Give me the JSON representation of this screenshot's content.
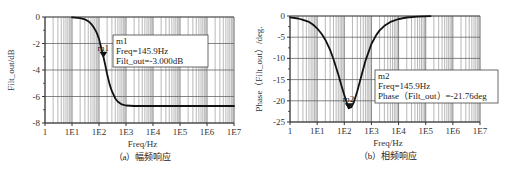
{
  "chart_data": [
    {
      "type": "line",
      "id": "magnitude",
      "caption": "（a）幅频响应",
      "xlabel": "Freq/Hz",
      "ylabel": "Filt_out/dB",
      "xscale": "log",
      "xlim": [
        1,
        10000000
      ],
      "ylim": [
        -8,
        0
      ],
      "x_ticks": [
        "1",
        "1E1",
        "1E2",
        "1E3",
        "1E4",
        "1E5",
        "1E6",
        "1E7"
      ],
      "y_ticks": [
        "0",
        "-2",
        "-4",
        "-6",
        "-8"
      ],
      "y_tick_values": [
        0,
        -2,
        -4,
        -6,
        -8
      ],
      "grid": true,
      "series": [
        {
          "name": "Filt_out",
          "x": [
            10,
            20,
            30,
            40,
            50,
            60,
            70,
            80,
            90,
            100,
            120,
            145.9,
            170,
            200,
            250,
            300,
            400,
            500,
            700,
            1000,
            2000,
            5000,
            10000,
            20000,
            100000,
            1000000,
            10000000
          ],
          "y": [
            -0.02,
            -0.08,
            -0.18,
            -0.32,
            -0.5,
            -0.7,
            -0.92,
            -1.15,
            -1.4,
            -1.65,
            -2.3,
            -3.0,
            -3.6,
            -4.3,
            -5.1,
            -5.6,
            -6.15,
            -6.4,
            -6.6,
            -6.68,
            -6.72,
            -6.72,
            -6.72,
            -6.72,
            -6.72,
            -6.72,
            -6.72
          ]
        }
      ],
      "marker": {
        "name": "m1",
        "freq_label": "Freq=145.9Hz",
        "value_label": "Filt_out=-3.000dB",
        "freq": 145.9,
        "value": -3.0
      }
    },
    {
      "type": "line",
      "id": "phase",
      "caption": "（b）相频响应",
      "xlabel": "Freq/Hz",
      "ylabel": "Phase（Filt_out）/deg.",
      "xscale": "log",
      "xlim": [
        1,
        10000000
      ],
      "ylim": [
        -25,
        0
      ],
      "x_ticks": [
        "1",
        "1E1",
        "1E2",
        "1E3",
        "1E4",
        "1E5",
        "1E6",
        "1E7"
      ],
      "y_ticks": [
        "0",
        "-5",
        "-10",
        "-15",
        "-20",
        "-25"
      ],
      "y_tick_values": [
        0,
        -5,
        -10,
        -15,
        -20,
        -25
      ],
      "grid": true,
      "series": [
        {
          "name": "Phase(Filt_out)",
          "x": [
            1,
            2,
            3,
            5,
            7,
            10,
            15,
            20,
            30,
            40,
            60,
            80,
            100,
            120,
            145.9,
            180,
            220,
            300,
            400,
            600,
            1000,
            1500,
            2000,
            3000,
            5000,
            10000,
            20000,
            50000,
            150000
          ],
          "y": [
            -0.3,
            -0.6,
            -0.9,
            -1.4,
            -2.0,
            -2.9,
            -4.3,
            -5.6,
            -8.0,
            -10.2,
            -13.8,
            -16.6,
            -18.6,
            -20.2,
            -21.76,
            -21.5,
            -20.5,
            -17.8,
            -14.8,
            -10.6,
            -6.6,
            -4.5,
            -3.4,
            -2.3,
            -1.4,
            -0.7,
            -0.35,
            -0.14,
            -0.05
          ]
        }
      ],
      "marker": {
        "name": "m2",
        "freq_label": "Freq=145.9Hz",
        "value_label": "Phase（Filt_out）=-21.76deg",
        "freq": 145.9,
        "value": -21.76
      }
    }
  ],
  "layout": {
    "plots": [
      {
        "x0": 45,
        "x1": 234,
        "y0": 17,
        "y1": 123,
        "marker_box": [
          113,
          35,
          95,
          32
        ],
        "ylabel_x": 14
      },
      {
        "x0": 290,
        "x1": 480,
        "y0": 16,
        "y1": 122,
        "marker_box": [
          375,
          70,
          123,
          33
        ],
        "ylabel_x": 262
      }
    ]
  }
}
